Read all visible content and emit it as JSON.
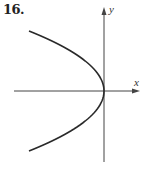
{
  "problem_number": "16.",
  "chart_data": {
    "type": "line",
    "title": "16.",
    "xlabel": "x",
    "ylabel": "y",
    "series": [
      {
        "name": "curve",
        "equation_shape": "x = -k*y^2",
        "vertex": [
          0,
          0
        ],
        "x": [
          -1,
          -0.5625,
          -0.25,
          -0.0625,
          0,
          -0.0625,
          -0.25,
          -0.5625,
          -1
        ],
        "y": [
          1,
          0.75,
          0.5,
          0.25,
          0,
          -0.25,
          -0.5,
          -0.75,
          -1
        ]
      }
    ],
    "grid": false,
    "ticks": false,
    "axes": {
      "x_arrow": "right",
      "y_arrow": "up"
    }
  },
  "colors": {
    "axis": "#444444",
    "curve": "#2a2a2a",
    "text": "#222222"
  }
}
